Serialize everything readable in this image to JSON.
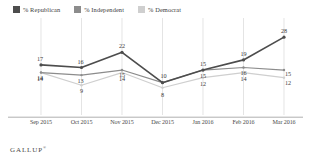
{
  "legend": {
    "position": "top-left",
    "items": [
      {
        "label": "% Republican",
        "color": "#4d4d4d"
      },
      {
        "label": "% Independent",
        "color": "#8c8c8c"
      },
      {
        "label": "% Democrat",
        "color": "#cfcfcf"
      }
    ]
  },
  "footer": {
    "brand": "GALLUP",
    "mark": "®"
  },
  "chart_data": {
    "type": "line",
    "title": "",
    "subtitle": "",
    "xlabel": "",
    "ylabel": "",
    "grid": true,
    "gridlines": "vertical",
    "ylim": [
      0,
      32
    ],
    "categories": [
      "Sep 2015",
      "Oct 2015",
      "Nov 2015",
      "Dec 2015",
      "Jan 2016",
      "Feb 2016",
      "Mar 2016"
    ],
    "series": [
      {
        "name": "% Republican",
        "color": "#4d4d4d",
        "values": [
          17,
          16,
          22,
          10,
          15,
          19,
          28
        ]
      },
      {
        "name": "% Independent",
        "color": "#8c8c8c",
        "values": [
          14,
          13,
          15,
          10,
          15,
          16,
          15
        ]
      },
      {
        "name": "% Democrat",
        "color": "#cfcfcf",
        "values": [
          14,
          9,
          14,
          8,
          12,
          14,
          12
        ]
      }
    ],
    "point_labels": {
      "% Republican": [
        "17",
        "16",
        "22",
        "10",
        "15",
        "19",
        "28"
      ],
      "% Independent": [
        "14",
        "13",
        "15",
        "",
        "15",
        "16",
        "15"
      ],
      "% Democrat": [
        "14",
        "9",
        "14",
        "8",
        "12",
        "14",
        "12"
      ]
    }
  }
}
